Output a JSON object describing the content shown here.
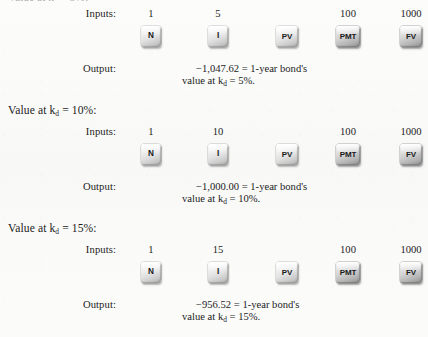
{
  "document": {
    "type": "scanned-textbook-figure",
    "clipped_top_heading": "Value at kᵈ = 5%:",
    "row_labels": {
      "inputs": "Inputs:",
      "output": "Output:"
    },
    "key_row": [
      {
        "name": "N",
        "label": "N",
        "width": "narrow",
        "dark": false,
        "x": 25
      },
      {
        "name": "I",
        "label": "I",
        "width": "narrow",
        "dark": false,
        "x": 92
      },
      {
        "name": "PV",
        "label": "PV",
        "width": "mid",
        "dark": false,
        "x": 161
      },
      {
        "name": "PMT",
        "label": "PMT",
        "width": "wide",
        "dark": true,
        "x": 222
      },
      {
        "name": "FV",
        "label": "FV",
        "width": "mid",
        "dark": true,
        "x": 285
      }
    ],
    "blocks": [
      {
        "id": "kd-5",
        "heading_visible": false,
        "heading_text": "Value at kᵈ = 5%:",
        "inputs": [
          {
            "key": "N",
            "value": "1",
            "x": 25
          },
          {
            "key": "I",
            "value": "5",
            "x": 92
          },
          {
            "key": "PV",
            "value": "",
            "x": 161
          },
          {
            "key": "PMT",
            "value": "100",
            "x": 222
          },
          {
            "key": "FV",
            "value": "1000",
            "x": 285
          }
        ],
        "output_line1": "−1,047.62 = 1-year bond's",
        "output_line2_prefix": "value at k",
        "output_line2_sub": "d",
        "output_line2_suffix": " = 5%."
      },
      {
        "id": "kd-10",
        "heading_visible": true,
        "heading_prefix": "Value at k",
        "heading_sub": "d",
        "heading_suffix": " = 10%:",
        "inputs": [
          {
            "key": "N",
            "value": "1",
            "x": 25
          },
          {
            "key": "I",
            "value": "10",
            "x": 92
          },
          {
            "key": "PV",
            "value": "",
            "x": 161
          },
          {
            "key": "PMT",
            "value": "100",
            "x": 222
          },
          {
            "key": "FV",
            "value": "1000",
            "x": 285
          }
        ],
        "output_line1": "−1,000.00 = 1-year bond's",
        "output_line2_prefix": "value at k",
        "output_line2_sub": "d",
        "output_line2_suffix": " = 10%."
      },
      {
        "id": "kd-15",
        "heading_visible": true,
        "heading_prefix": "Value at k",
        "heading_sub": "d",
        "heading_suffix": " = 15%:",
        "inputs": [
          {
            "key": "N",
            "value": "1",
            "x": 25
          },
          {
            "key": "I",
            "value": "15",
            "x": 92
          },
          {
            "key": "PV",
            "value": "",
            "x": 161
          },
          {
            "key": "PMT",
            "value": "100",
            "x": 222
          },
          {
            "key": "FV",
            "value": "1000",
            "x": 285
          }
        ],
        "output_line1": "−956.52 = 1-year bond's",
        "output_line2_prefix": "value at k",
        "output_line2_sub": "d",
        "output_line2_suffix": " = 15%."
      }
    ]
  }
}
